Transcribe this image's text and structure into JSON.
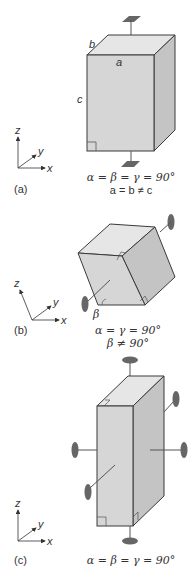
{
  "figure": {
    "colors": {
      "front_face": "#d6d6d6",
      "top_face": "#e6e6e6",
      "side_face": "#c4c4c4",
      "edge": "#3a3a3a",
      "mount": "#666666",
      "text": "#333333"
    },
    "panels": [
      {
        "id": "a",
        "label": "(a)",
        "axes": {
          "z": "z",
          "y": "y",
          "x": "x"
        },
        "edge_labels": {
          "a": "a",
          "b": "b",
          "c": "c"
        },
        "angle_condition": "α = β = γ = 90°",
        "length_condition": "a = b ≠ c",
        "symmetry_element": "4-fold axis vertical (square mounts top and bottom)"
      },
      {
        "id": "b",
        "label": "(b)",
        "axes": {
          "z": "z",
          "y": "y",
          "x": "x"
        },
        "angle_label": "β",
        "angle_condition": "α = γ = 90°",
        "angle_condition_2": "β ≠ 90°",
        "symmetry_element": "2-fold axis (oval mounts)"
      },
      {
        "id": "c",
        "label": "(c)",
        "axes": {
          "z": "z",
          "y": "y",
          "x": "x"
        },
        "angle_condition": "α = β = γ = 90°",
        "symmetry_element": "three 2-fold axes (oval mounts)"
      }
    ]
  }
}
